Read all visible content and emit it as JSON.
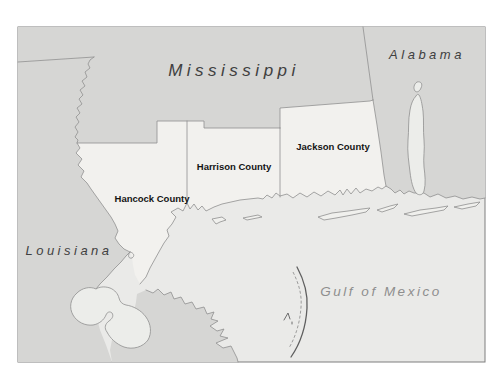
{
  "map": {
    "type": "region-map",
    "subject": "Mississippi Gulf Coast counties"
  },
  "regions": {
    "mississippi": {
      "label": "Mississippi"
    },
    "alabama": {
      "label": "Alabama"
    },
    "louisiana": {
      "label": "Louisiana"
    }
  },
  "counties": {
    "hancock": {
      "label": "Hancock County"
    },
    "harrison": {
      "label": "Harrison County"
    },
    "jackson": {
      "label": "Jackson County"
    }
  },
  "water_bodies": {
    "gulf_of_mexico": {
      "label": "Gulf of Mexico"
    }
  },
  "colors": {
    "page_background": "#ffffff",
    "state_fill": "#d6d6d4",
    "county_fill": "#f2f1ee",
    "water_fill": "#eaeae8",
    "boundary_line": "#8f8f8f",
    "frame_border": "#7f7f7f",
    "state_label_text": "#404040",
    "water_label_text": "#8e8e8e",
    "county_label_text": "#141414",
    "island_chain_line": "#5f5f5f"
  }
}
